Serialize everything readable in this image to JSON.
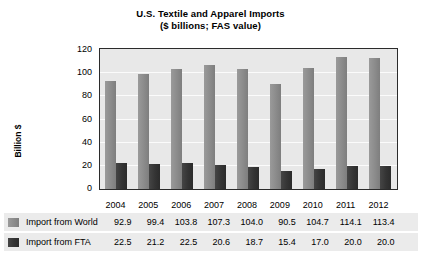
{
  "chart_data": {
    "type": "bar",
    "title": "U.S. Textile and Apparel Imports",
    "subtitle": "($ billions; FAS value)",
    "xlabel": "",
    "ylabel": "Billion $",
    "ylim": [
      0,
      120
    ],
    "yticks": [
      120,
      100,
      80,
      60,
      40,
      20,
      0
    ],
    "grid": true,
    "legend_position": "bottom-table",
    "categories": [
      "2004",
      "2005",
      "2006",
      "2007",
      "2008",
      "2009",
      "2010",
      "2011",
      "2012"
    ],
    "series": [
      {
        "name": "Import from World",
        "color": "#8b8b8b",
        "values": [
          92.9,
          99.4,
          103.8,
          107.3,
          104.0,
          90.5,
          104.7,
          114.1,
          113.4
        ]
      },
      {
        "name": "Import from FTA",
        "color": "#343434",
        "values": [
          22.5,
          21.2,
          22.5,
          20.6,
          18.7,
          15.4,
          17.0,
          20.0,
          20.0
        ]
      }
    ]
  },
  "display": {
    "world_values_text": [
      "92.9",
      "99.4",
      "103.8",
      "107.3",
      "104.0",
      "90.5",
      "104.7",
      "114.1",
      "113.4"
    ],
    "fta_values_text": [
      "22.5",
      "21.2",
      "22.5",
      "20.6",
      "18.7",
      "15.4",
      "17.0",
      "20.0",
      "20.0"
    ],
    "ytick_labels": [
      "120",
      "100",
      "80",
      "60",
      "40",
      "20",
      "0"
    ]
  }
}
